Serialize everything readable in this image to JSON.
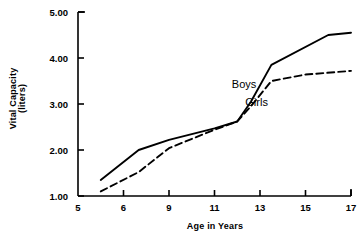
{
  "chart_data": {
    "type": "line",
    "title": "",
    "xlabel": "Age in Years",
    "ylabel": "Vital Capacity (liters)",
    "ylabel_line1": "Vital Capacity",
    "ylabel_line2": "(liters)",
    "xlim": [
      5,
      17
    ],
    "ylim": [
      1.0,
      5.0
    ],
    "grid": false,
    "legend_position": "inline-annotations",
    "xticks": [
      5,
      6,
      9,
      11,
      13,
      15,
      17
    ],
    "xtick_labels": [
      "5",
      "6",
      "9",
      "11",
      "13",
      "15",
      "17"
    ],
    "yticks": [
      1.0,
      2.0,
      3.0,
      4.0,
      5.0
    ],
    "ytick_labels": [
      "1.00",
      "2.00",
      "3.00",
      "4.00",
      "5.00"
    ],
    "series": [
      {
        "name": "Boys",
        "style": "solid",
        "color": "#000000",
        "label_x": 12.3,
        "label_y": 3.35,
        "x": [
          5.5,
          7.0,
          9.0,
          11.0,
          12.0,
          12.6,
          13.5,
          16.0,
          17.0
        ],
        "values": [
          1.35,
          2.0,
          2.22,
          2.47,
          2.62,
          3.05,
          3.85,
          4.5,
          4.55
        ]
      },
      {
        "name": "Girls",
        "style": "dashed",
        "color": "#000000",
        "label_x": 12.85,
        "label_y": 2.95,
        "x": [
          5.5,
          7.0,
          9.0,
          11.0,
          12.0,
          12.6,
          13.5,
          15.0,
          17.0
        ],
        "values": [
          1.1,
          1.52,
          2.04,
          2.44,
          2.62,
          2.95,
          3.5,
          3.64,
          3.72
        ]
      }
    ]
  },
  "axes": {
    "x_axis_title": "Age in Years",
    "y_axis_title_line1": "Vital Capacity",
    "y_axis_title_line2": "(liters)"
  },
  "colors": {
    "ink": "#000000",
    "background": "#ffffff"
  }
}
